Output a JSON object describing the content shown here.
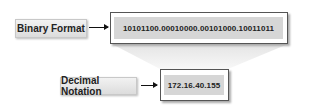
{
  "diagram": {
    "binary": {
      "label": "Binary Format",
      "value": "10101100.00010000.00101000.10011011"
    },
    "decimal": {
      "label": "Decimal Notation",
      "value": "172.16.40.155"
    }
  },
  "colors": {
    "label_bg": "#e6e6e6",
    "value_bg": "#d6d6d6",
    "border": "#555555",
    "funnel": "#eeeeee"
  }
}
